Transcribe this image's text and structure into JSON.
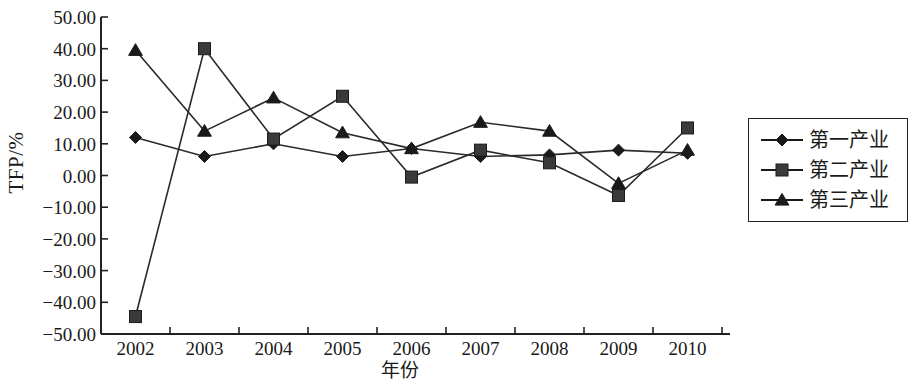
{
  "chart_data": {
    "type": "line",
    "title": "",
    "xlabel": "年份",
    "ylabel": "TFP/%",
    "categories": [
      "2002",
      "2003",
      "2004",
      "2005",
      "2006",
      "2007",
      "2008",
      "2009",
      "2010"
    ],
    "ylim": [
      -50,
      50
    ],
    "yticks": [
      "50.00",
      "40.00",
      "30.00",
      "20.00",
      "10.00",
      "0.00",
      "-10.00",
      "-20.00",
      "-30.00",
      "-40.00",
      "-50.00"
    ],
    "ytick_values": [
      50,
      40,
      30,
      20,
      10,
      0,
      -10,
      -20,
      -30,
      -40,
      -50
    ],
    "grid": false,
    "legend_position": "right",
    "series": [
      {
        "name": "第一产业",
        "marker": "diamond",
        "values": [
          12.0,
          6.0,
          10.0,
          6.0,
          8.5,
          6.0,
          6.5,
          8.0,
          7.0
        ]
      },
      {
        "name": "第二产业",
        "marker": "square",
        "values": [
          -44.5,
          40.0,
          11.5,
          25.0,
          -0.5,
          8.0,
          4.0,
          -6.3,
          15.0
        ]
      },
      {
        "name": "第三产业",
        "marker": "triangle",
        "values": [
          39.5,
          14.0,
          24.5,
          13.5,
          8.5,
          16.8,
          14.0,
          -2.5,
          8.0
        ]
      }
    ]
  },
  "legend": {
    "items": [
      {
        "label": "第一产业",
        "marker": "diamond"
      },
      {
        "label": "第二产业",
        "marker": "square"
      },
      {
        "label": "第三产业",
        "marker": "triangle"
      }
    ]
  }
}
